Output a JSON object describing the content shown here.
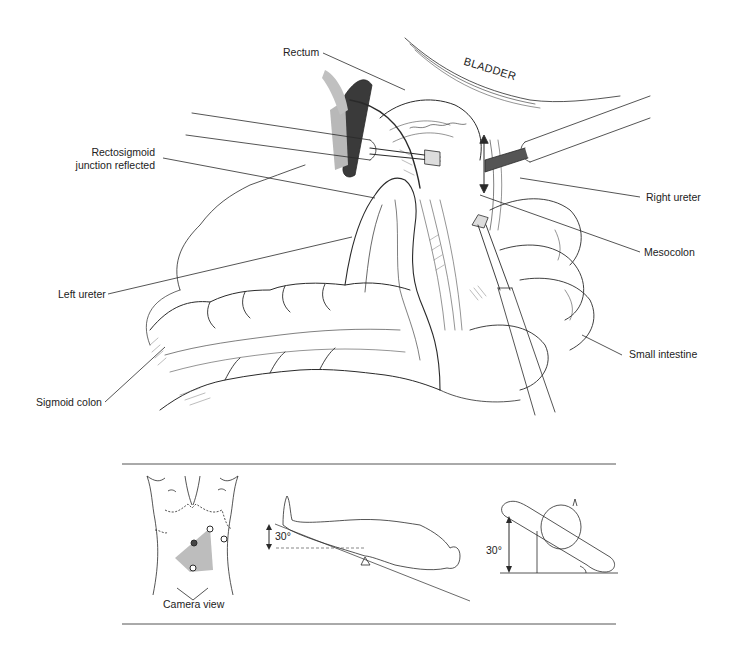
{
  "figure": {
    "main_labels": {
      "rectum": "Rectum",
      "bladder": "BLADDER",
      "rectosigmoid_line1": "Rectosigmoid",
      "rectosigmoid_line2": "junction reflected",
      "right_ureter": "Right ureter",
      "mesocolon": "Mesocolon",
      "left_ureter": "Left ureter",
      "small_intestine": "Small intestine",
      "sigmoid_colon": "Sigmoid colon"
    },
    "inset": {
      "camera_caption": "Camera view",
      "trendelenburg_angle": "30°",
      "lateral_tilt_angle": "30°",
      "port_sites": [
        {
          "id": "upper-right-port",
          "filled": false
        },
        {
          "id": "camera-port",
          "filled": true
        },
        {
          "id": "lower-port",
          "filled": false
        },
        {
          "id": "far-right-port",
          "filled": false
        }
      ],
      "camera_field_color": "#bdbdbd"
    },
    "colors": {
      "line": "#2a2a2a",
      "shade": "#9a9a9a",
      "rule": "#555555"
    }
  }
}
